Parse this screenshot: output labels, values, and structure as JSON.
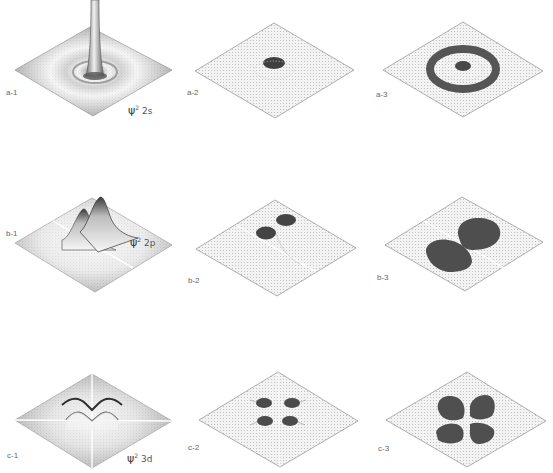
{
  "figure": {
    "rows": [
      {
        "id": "a",
        "orbital": "2s",
        "psi_label": {
          "symbol": "ψ",
          "power": "2",
          "orbital": "2s"
        },
        "panels": [
          {
            "label": "a-1",
            "type": "3d-surface"
          },
          {
            "label": "a-2",
            "type": "threshold-plot"
          },
          {
            "label": "a-3",
            "type": "threshold-plot"
          }
        ]
      },
      {
        "id": "b",
        "orbital": "2p",
        "psi_label": {
          "symbol": "ψ",
          "power": "2",
          "orbital": "2p"
        },
        "panels": [
          {
            "label": "b-1",
            "type": "3d-surface"
          },
          {
            "label": "b-2",
            "type": "threshold-plot"
          },
          {
            "label": "b-3",
            "type": "threshold-plot"
          }
        ]
      },
      {
        "id": "c",
        "orbital": "3d",
        "psi_label": {
          "symbol": "ψ",
          "power": "2",
          "orbital": "3d"
        },
        "panels": [
          {
            "label": "c-1",
            "type": "3d-surface"
          },
          {
            "label": "c-2",
            "type": "threshold-plot"
          },
          {
            "label": "c-3",
            "type": "threshold-plot"
          }
        ]
      }
    ],
    "colors": {
      "background": "#ffffff",
      "surface_dark": "#8a8a8a",
      "surface_light": "#e6e6e6",
      "plane_fill": "#f1f1f1",
      "plane_edge": "#9a9a9a",
      "lobe_fill": "#555555"
    }
  }
}
